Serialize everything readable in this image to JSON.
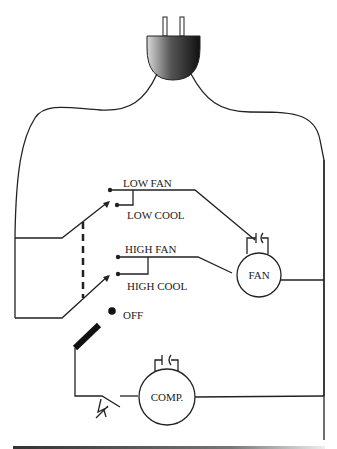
{
  "diagram": {
    "components": {
      "plug": {
        "name": "power plug"
      },
      "selector_switch": {
        "positions": [
          {
            "label": "LOW FAN"
          },
          {
            "label": "LOW COOL"
          },
          {
            "label": "HIGH FAN"
          },
          {
            "label": "HIGH COOL"
          },
          {
            "label": "OFF"
          }
        ]
      },
      "fan_motor": {
        "label": "FAN"
      },
      "compressor": {
        "label": "COMP."
      },
      "thermostat": {
        "name": "thermostat switch"
      },
      "capacitors": [
        "fan capacitor",
        "compressor capacitor"
      ]
    },
    "colors": {
      "line": "#222222",
      "background": "#ffffff"
    }
  }
}
